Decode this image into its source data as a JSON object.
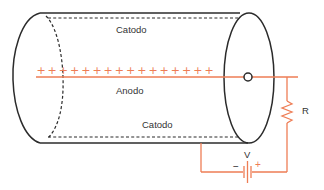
{
  "labels": {
    "catodo_top": "Catodo",
    "anodo": "Anodo",
    "catodo_bottom": "Catodo",
    "resistor": "R",
    "voltage": "V",
    "battery_minus": "−",
    "battery_plus": "+"
  },
  "anode_charge": {
    "symbol": "+",
    "count": 16
  },
  "colors": {
    "outline": "#2b2b2b",
    "circuit": "#ee7d55",
    "text": "#333333",
    "background": "#ffffff"
  }
}
